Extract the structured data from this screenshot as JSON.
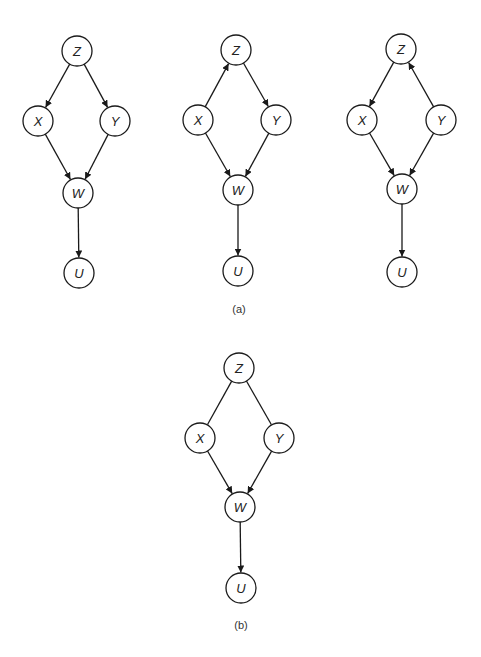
{
  "node_radius": 15,
  "colors": {
    "stroke": "#1a1a1a",
    "fill": "#ffffff",
    "text": "#222222"
  },
  "panels": [
    {
      "id": "a1",
      "nodes": [
        {
          "id": "Z",
          "label": "Z",
          "x": 77,
          "y": 51
        },
        {
          "id": "X",
          "label": "X",
          "x": 38,
          "y": 121
        },
        {
          "id": "Y",
          "label": "Y",
          "x": 115,
          "y": 121
        },
        {
          "id": "W",
          "label": "W",
          "x": 78,
          "y": 193
        },
        {
          "id": "U",
          "label": "U",
          "x": 79,
          "y": 273
        }
      ],
      "edges": [
        {
          "from": "Z",
          "to": "X",
          "directed": true
        },
        {
          "from": "Z",
          "to": "Y",
          "directed": true
        },
        {
          "from": "X",
          "to": "W",
          "directed": true
        },
        {
          "from": "Y",
          "to": "W",
          "directed": true
        },
        {
          "from": "W",
          "to": "U",
          "directed": true
        }
      ]
    },
    {
      "id": "a2",
      "nodes": [
        {
          "id": "Z",
          "label": "Z",
          "x": 236,
          "y": 50
        },
        {
          "id": "X",
          "label": "X",
          "x": 198,
          "y": 120
        },
        {
          "id": "Y",
          "label": "Y",
          "x": 276,
          "y": 120
        },
        {
          "id": "W",
          "label": "W",
          "x": 238,
          "y": 190
        },
        {
          "id": "U",
          "label": "U",
          "x": 238,
          "y": 271
        }
      ],
      "edges": [
        {
          "from": "X",
          "to": "Z",
          "directed": true
        },
        {
          "from": "Z",
          "to": "Y",
          "directed": true
        },
        {
          "from": "X",
          "to": "W",
          "directed": true
        },
        {
          "from": "Y",
          "to": "W",
          "directed": true
        },
        {
          "from": "W",
          "to": "U",
          "directed": true
        }
      ]
    },
    {
      "id": "a3",
      "nodes": [
        {
          "id": "Z",
          "label": "Z",
          "x": 401,
          "y": 49
        },
        {
          "id": "X",
          "label": "X",
          "x": 362,
          "y": 120
        },
        {
          "id": "Y",
          "label": "Y",
          "x": 441,
          "y": 120
        },
        {
          "id": "W",
          "label": "W",
          "x": 402,
          "y": 189
        },
        {
          "id": "U",
          "label": "U",
          "x": 402,
          "y": 272
        }
      ],
      "edges": [
        {
          "from": "Z",
          "to": "X",
          "directed": true
        },
        {
          "from": "Y",
          "to": "Z",
          "directed": true
        },
        {
          "from": "X",
          "to": "W",
          "directed": true
        },
        {
          "from": "Y",
          "to": "W",
          "directed": true
        },
        {
          "from": "W",
          "to": "U",
          "directed": true
        }
      ]
    },
    {
      "id": "b",
      "nodes": [
        {
          "id": "Z",
          "label": "Z",
          "x": 239,
          "y": 368
        },
        {
          "id": "X",
          "label": "X",
          "x": 200,
          "y": 438
        },
        {
          "id": "Y",
          "label": "Y",
          "x": 279,
          "y": 438
        },
        {
          "id": "W",
          "label": "W",
          "x": 240,
          "y": 507
        },
        {
          "id": "U",
          "label": "U",
          "x": 241,
          "y": 588
        }
      ],
      "edges": [
        {
          "from": "Z",
          "to": "X",
          "directed": false
        },
        {
          "from": "Z",
          "to": "Y",
          "directed": false
        },
        {
          "from": "X",
          "to": "W",
          "directed": true
        },
        {
          "from": "Y",
          "to": "W",
          "directed": true
        },
        {
          "from": "W",
          "to": "U",
          "directed": true
        }
      ]
    }
  ],
  "captions": [
    {
      "id": "caption-a",
      "text": "(a)",
      "x": 239,
      "y": 309
    },
    {
      "id": "caption-b",
      "text": "(b)",
      "x": 241,
      "y": 625
    }
  ]
}
